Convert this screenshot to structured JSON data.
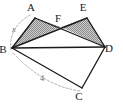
{
  "figure": {
    "background_color": "#ffffff",
    "stroke_color": "#1a1a1a",
    "shade_fill_color": "#9e9e9e",
    "dash_color": "#8c8c8c",
    "label_color": "#1a1a1a",
    "measure_color": "#6b6b6b"
  },
  "vertices": [
    {
      "id": "A",
      "label": "A",
      "point_x": 35,
      "point_y": 18,
      "label_x": 31,
      "label_y": 11
    },
    {
      "id": "B",
      "label": "B",
      "point_x": 12,
      "point_y": 48,
      "label_x": 3,
      "label_y": 53
    },
    {
      "id": "C",
      "label": "C",
      "point_x": 82,
      "point_y": 88,
      "label_x": 79,
      "label_y": 100
    },
    {
      "id": "D",
      "label": "D",
      "point_x": 105,
      "point_y": 47,
      "label_x": 109,
      "label_y": 52
    },
    {
      "id": "E",
      "label": "E",
      "point_x": 87,
      "point_y": 18,
      "label_x": 83,
      "label_y": 11
    },
    {
      "id": "F",
      "label": "F",
      "point_x": 61,
      "point_y": 27,
      "label_x": 58,
      "label_y": 22
    }
  ],
  "shaded_triangles": [
    {
      "name": "triangle-baf",
      "points": "12,48 35,18 61,27"
    },
    {
      "name": "triangle-fed",
      "points": "61,27 87,18 105,47"
    }
  ],
  "segments": [
    {
      "name": "segment-b-a",
      "x1": 12,
      "y1": 48,
      "x2": 35,
      "y2": 18
    },
    {
      "name": "segment-a-d",
      "x1": 35,
      "y1": 18,
      "x2": 105,
      "y2": 47
    },
    {
      "name": "segment-b-e",
      "x1": 12,
      "y1": 48,
      "x2": 87,
      "y2": 18
    },
    {
      "name": "segment-e-d",
      "x1": 87,
      "y1": 18,
      "x2": 105,
      "y2": 47
    },
    {
      "name": "segment-b-d",
      "x1": 12,
      "y1": 48,
      "x2": 105,
      "y2": 47
    },
    {
      "name": "segment-b-c",
      "x1": 12,
      "y1": 48,
      "x2": 82,
      "y2": 88
    },
    {
      "name": "segment-c-d",
      "x1": 82,
      "y1": 88,
      "x2": 105,
      "y2": 47
    }
  ],
  "measures": [
    {
      "name": "measure-x-ab",
      "label": "x",
      "italic": true,
      "arc_path": "M 30,15 Q 8,28 11,50",
      "label_x": 14,
      "label_y": 32
    },
    {
      "name": "measure-4-bc",
      "label": "4",
      "italic": false,
      "arc_path": "M 13,53 Q 44,86 80,91",
      "label_x": 42,
      "label_y": 81
    }
  ]
}
